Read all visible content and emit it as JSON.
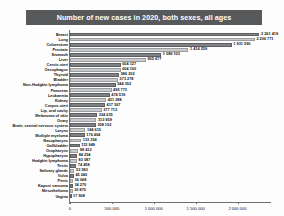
{
  "chart_data": {
    "type": "bar",
    "orientation": "horizontal",
    "title": "Number of new cases in 2020, both sexes, all ages",
    "xlabel": "",
    "ylabel": "",
    "xlim": [
      0,
      2400000
    ],
    "grid": false,
    "legend": null,
    "xticks": [
      0,
      500000,
      1000000,
      1500000,
      2000000
    ],
    "xticklabels": [
      "0",
      "500 000",
      "1 000 000",
      "1 500 000",
      "2 000 000"
    ],
    "categories": [
      "Breast",
      "Lung",
      "Colorectum",
      "Prostate",
      "Stomach",
      "Liver",
      "Cervix uteri",
      "Oesophagus",
      "Thyroid",
      "Bladder",
      "Non-Hodgkin lymphoma",
      "Pancreas",
      "Leukaemia",
      "Kidney",
      "Corpus uteri",
      "Lip, oral cavity",
      "Melanoma of skin",
      "Ovary",
      "Brain, central nervous system",
      "Larynx",
      "Multiple myeloma",
      "Nasopharynx",
      "Gallbladder",
      "Oropharynx",
      "Hypopharynx",
      "Hodgkin lymphoma",
      "Testis",
      "Salivary glands",
      "Vulva",
      "Penis",
      "Kaposi sarcoma",
      "Mesothelioma",
      "Vagina"
    ],
    "values": [
      2261419,
      2206771,
      1931590,
      1414259,
      1089103,
      905677,
      604127,
      604100,
      586202,
      573278,
      544352,
      495773,
      474519,
      431288,
      417367,
      377713,
      324635,
      313959,
      308102,
      184615,
      176404,
      133354,
      115949,
      98412,
      84254,
      83087,
      74458,
      53583,
      45240,
      36068,
      34270,
      30870,
      17908
    ],
    "value_labels": [
      "2 261 419",
      "2 206 771",
      "1 931 590",
      "1 414 259",
      "1 089 103",
      "905 677",
      "604 127",
      "604 100",
      "586 202",
      "573 278",
      "544 352",
      "495 773",
      "474 519",
      "431 288",
      "417 367",
      "377 713",
      "324 635",
      "313 959",
      "308 102",
      "184 615",
      "176 404",
      "133 354",
      "115 949",
      "98 412",
      "84 254",
      "83 087",
      "74 458",
      "53 583",
      "45 240",
      "36 068",
      "34 270",
      "30 870",
      "17 908"
    ],
    "colors": {
      "bar_dark": "#808285",
      "bar_light": "#c9cbcd",
      "title_banner": "#58595b",
      "title_text": "#ffffff",
      "axis": "#6d6e71",
      "text": "#111111",
      "background": "#fdfdfd"
    }
  }
}
